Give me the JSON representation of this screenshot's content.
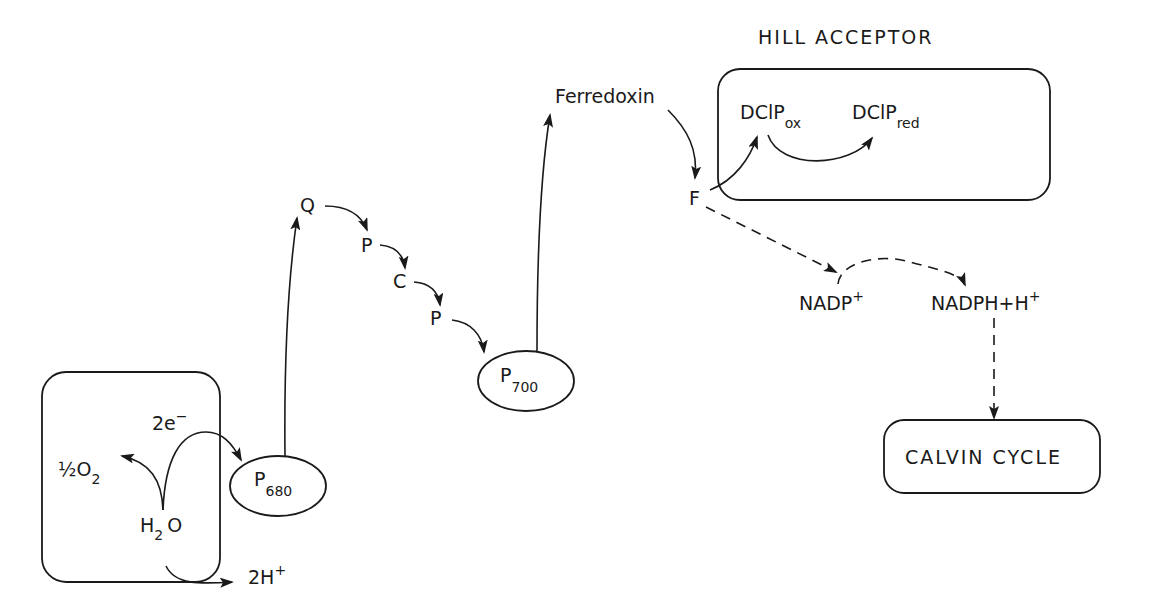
{
  "diagram": {
    "title": "HILL ACCEPTOR",
    "water_box": {
      "electrons": "2e",
      "electrons_sup": "−",
      "oxygen_prefix": "½O",
      "oxygen_sub": "2",
      "water_h": "H",
      "water_sub": "2",
      "water_o": "O",
      "protons": "2H",
      "protons_sup": "+"
    },
    "p680": {
      "main": "P",
      "sub": "680"
    },
    "chain": {
      "q": "Q",
      "p1": "P",
      "c": "C",
      "p2": "P"
    },
    "p700": {
      "main": "P",
      "sub": "700"
    },
    "ferredoxin": "Ferredoxin",
    "f": "F",
    "hill_box": {
      "ox_main": "DClP",
      "ox_sub": "ox",
      "red_main": "DClP",
      "red_sub": "red"
    },
    "nadp": {
      "main": "NADP",
      "sup": "+"
    },
    "nadph": {
      "main": "NADPH+H",
      "sup": "+"
    },
    "calvin": "CALVIN CYCLE"
  }
}
